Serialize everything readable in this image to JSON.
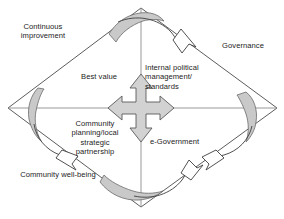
{
  "diagram": {
    "shape": "diamond",
    "colors": {
      "stroke": "#4a4a4a",
      "swoosh_fill": "#c9c9c9",
      "cross_fill": "#d2d2d2",
      "cross_stroke": "#595959",
      "background": "#ffffff",
      "text": "#232323"
    },
    "outer_labels": [
      {
        "id": "continuous-improvement",
        "text": "Continuous\nimprovement",
        "corner": "top-left"
      },
      {
        "id": "governance",
        "text": "Governance",
        "corner": "top-right"
      },
      {
        "id": "community-well-being",
        "text": "Community well-being",
        "corner": "bottom-left"
      }
    ],
    "inner_labels": [
      {
        "id": "best-value",
        "text": "Best value",
        "quadrant": "top-left"
      },
      {
        "id": "internal-political-management",
        "text": "Internal political\nmanagement/\nstandards",
        "quadrant": "top-right"
      },
      {
        "id": "community-planning",
        "text": "Community\nplanning/local\nstrategic\npartnership",
        "quadrant": "bottom-left"
      },
      {
        "id": "e-government",
        "text": "e-Government",
        "quadrant": "bottom-right"
      }
    ],
    "center": {
      "id": "four-way-arrow-cross",
      "name": "four-way-arrow-icon",
      "directions": [
        "up",
        "right",
        "down",
        "left"
      ]
    },
    "flow_arrows": [
      {
        "id": "swoosh-top",
        "position": "top-vertex",
        "direction": "clockwise"
      },
      {
        "id": "swoosh-right",
        "position": "right-vertex",
        "direction": "clockwise"
      },
      {
        "id": "swoosh-bottom",
        "position": "bottom-vertex",
        "direction": "clockwise"
      },
      {
        "id": "swoosh-left",
        "position": "left-vertex",
        "direction": "clockwise"
      }
    ]
  }
}
